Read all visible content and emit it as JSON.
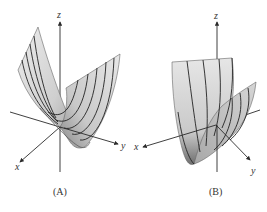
{
  "figure": {
    "panels": [
      {
        "id": "A",
        "caption": "(A)",
        "axes": {
          "x": "x",
          "y": "y",
          "z": "z"
        },
        "description": "Parabolic cylinder surface opening upward along x-direction with contour ribs"
      },
      {
        "id": "B",
        "caption": "(B)",
        "axes": {
          "x": "x",
          "y": "y",
          "z": "z"
        },
        "description": "Parabolic cylinder surface opening upward along y-direction with contour ribs"
      }
    ]
  },
  "colors": {
    "surface_light": "#e2e2e2",
    "surface_mid": "#c4c4c4",
    "surface_dark": "#7a7a7a",
    "axis": "#2a2a2a",
    "background": "#ffffff"
  }
}
